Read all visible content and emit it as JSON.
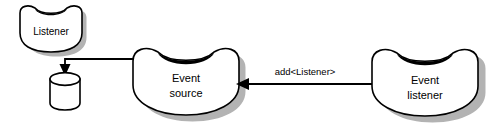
{
  "diagram": {
    "background_color": "#ffffff",
    "stroke_color": "#000000",
    "shadow_color": "#b3b3b3",
    "nodes": [
      {
        "id": "listener",
        "name": "listener-bean",
        "label": "Listener",
        "shape": "bean",
        "x": 52,
        "y": 30
      },
      {
        "id": "datastore",
        "name": "datastore-cylinder",
        "label": "",
        "shape": "cylinder",
        "x": 65,
        "y": 90
      },
      {
        "id": "event-source",
        "name": "event-source-bean",
        "label_line1": "Event",
        "label_line2": "source",
        "shape": "bean",
        "x": 186,
        "y": 86
      },
      {
        "id": "event-listener",
        "name": "event-listener-bean",
        "label_line1": "Event",
        "label_line2": "listener",
        "shape": "bean",
        "x": 425,
        "y": 88
      }
    ],
    "edges": [
      {
        "id": "source-to-store",
        "name": "edge-source-to-datastore",
        "label": "",
        "from": "event-source",
        "to": "datastore",
        "arrow": "down"
      },
      {
        "id": "listener-to-source",
        "name": "edge-listener-to-source",
        "label": "add<Listener>",
        "from": "event-listener",
        "to": "event-source",
        "arrow": "left",
        "label_x": 305,
        "label_y": 72
      }
    ]
  }
}
